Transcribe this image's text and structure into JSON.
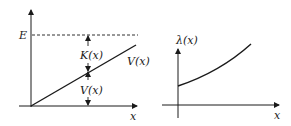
{
  "left_diagram": {
    "x_axis_label": "x",
    "energy_label": "E",
    "kinetic_label": "K(x)",
    "potential_label_inside": "V(x)",
    "potential_line_label": "V(x)"
  },
  "right_diagram": {
    "y_axis_label": "λ(x)",
    "x_axis_label": "x"
  },
  "colors": {
    "ink": "#1a1a1a",
    "background": "#ffffff"
  }
}
